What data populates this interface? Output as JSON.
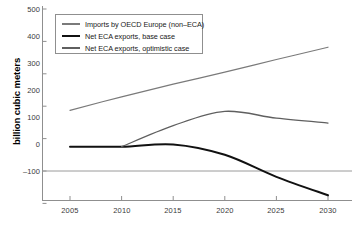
{
  "chart_data": {
    "type": "line",
    "title": "",
    "xlabel": "",
    "ylabel": "billion cubic meters",
    "x": [
      2005,
      2010,
      2015,
      2020,
      2025,
      2030
    ],
    "xlim": [
      2004,
      2031
    ],
    "ylim": [
      -100,
      500
    ],
    "yticks": [
      500,
      400,
      300,
      200,
      100,
      0,
      -100
    ],
    "xticks": [
      2005,
      2010,
      2015,
      2020,
      2025,
      2030
    ],
    "grid": false,
    "legend_position": "top-left",
    "series": [
      {
        "name": "Imports by OECD Europe (non–ECA)",
        "color": "#7a7a7a",
        "width": 1.2,
        "x": [
          2005,
          2010,
          2015,
          2020,
          2025,
          2030
        ],
        "values": [
          187,
          229,
          268,
          305,
          344,
          382
        ]
      },
      {
        "name": "Net ECA exports, base case",
        "color": "#111111",
        "width": 2.0,
        "x": [
          2005,
          2010,
          2015,
          2020,
          2025,
          2030
        ],
        "values": [
          75,
          75,
          82,
          50,
          -18,
          -75
        ]
      },
      {
        "name": "Net ECA exports, optimistic case",
        "color": "#5f5f5f",
        "width": 1.3,
        "x": [
          2010,
          2015,
          2020,
          2025,
          2030
        ],
        "values": [
          75,
          140,
          184,
          163,
          148
        ]
      }
    ]
  },
  "axes": {
    "y_labels": [
      "500",
      "400",
      "300",
      "200",
      "100",
      "0",
      "–100"
    ],
    "x_labels": [
      "2005",
      "2010",
      "2015",
      "2020",
      "2025",
      "2030"
    ],
    "y_title": "billion cubic meters"
  },
  "legend": {
    "items": [
      {
        "label": "Imports by OECD Europe (non–ECA)"
      },
      {
        "label": "Net ECA exports, base case"
      },
      {
        "label": "Net ECA exports, optimistic case"
      }
    ]
  }
}
